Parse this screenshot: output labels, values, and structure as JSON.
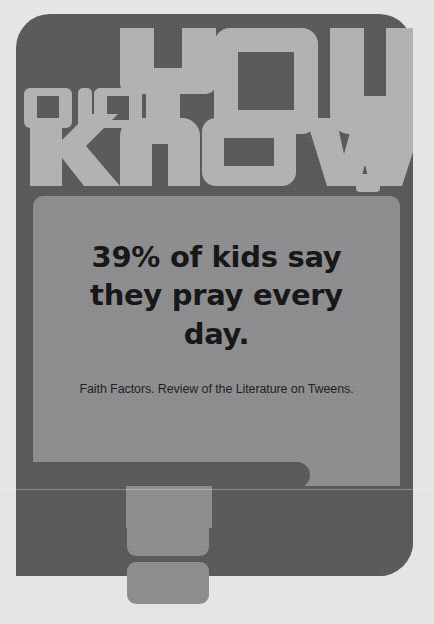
{
  "poster": {
    "title_lines": [
      "DID",
      "YOU",
      "KNOW?"
    ],
    "title_full": "DID YOU KNOW?",
    "headline": "39% of kids say they pray every day.",
    "statistic_value": "39%",
    "statistic_subject": "of kids say they pray every day.",
    "source": "Faith Factors. Review of the Literature on Tweens."
  },
  "colors": {
    "background": "#e9e9ea",
    "card": "#59595b",
    "panel": "#8e8e90",
    "logo_text": "#b4b4b6",
    "headline_text": "#131314",
    "source_text": "#1c1c1d"
  },
  "icons": {
    "did-glyph": "did-blocky-text-icon",
    "you-glyph": "you-blocky-text-icon",
    "know-glyph": "know-blocky-text-icon",
    "question-mark": "question-mark-icon",
    "deco-bar": "decorative-bar-shape",
    "deco-tab": "decorative-tab-shape"
  }
}
